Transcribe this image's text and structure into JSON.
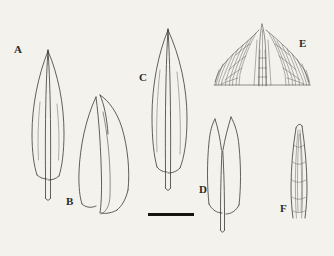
{
  "figure": {
    "type": "botanical-line-drawing-plate",
    "background_color": "#f4f2ed",
    "ink_color": "#3a3833",
    "width": 334,
    "height": 256
  },
  "specimens": [
    {
      "label": "A",
      "label_x": 14,
      "label_y": 44,
      "description": "lanceolate leaf, acuminate apex, strong excurrent midrib projecting below base"
    },
    {
      "label": "B",
      "label_x": 66,
      "label_y": 196,
      "description": "narrow curved keeled leaf, folded along midrib"
    },
    {
      "label": "C",
      "label_x": 139,
      "label_y": 72,
      "description": "broadly elliptic leaf, acuminate apex, midrib excurrent at base"
    },
    {
      "label": "D",
      "label_x": 199,
      "label_y": 184,
      "description": "oblong leaf with bilobed notched apex and central midrib"
    },
    {
      "label": "E",
      "label_x": 299,
      "label_y": 38,
      "description": "magnified leaf apex showing elongate cells and serrate-papillose margin"
    },
    {
      "label": "F",
      "label_x": 280,
      "label_y": 203,
      "description": "narrow linear leaf with visible elongate cell rows"
    }
  ],
  "scale_bar": {
    "name": "scale-bar",
    "x": 148,
    "y": 213,
    "length": 46,
    "thickness": 3,
    "label": ""
  }
}
